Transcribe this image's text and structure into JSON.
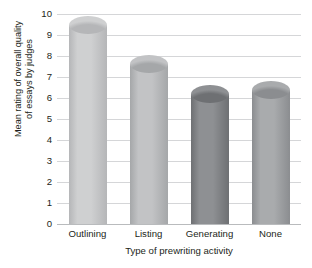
{
  "chart_data": {
    "type": "bar",
    "title": "",
    "xlabel": "Type of prewriting activity",
    "ylabel": "Mean rating of overall quality of essays by judges",
    "ylabel_lines": [
      "Mean rating of overall quality",
      "of essays by judges"
    ],
    "categories": [
      "Outlining",
      "Listing",
      "Generating",
      "None"
    ],
    "values": [
      9.5,
      7.6,
      6.2,
      6.4
    ],
    "ylim": [
      0,
      10
    ],
    "ytick_labels": [
      "10",
      "9",
      "8",
      "7",
      "6",
      "5",
      "4",
      "3",
      "2",
      "1",
      "0"
    ],
    "ytick_values": [
      10,
      9,
      8,
      7,
      6,
      5,
      4,
      3,
      2,
      1,
      0
    ],
    "grid": true,
    "legend": "none",
    "bar_colors": [
      "#cfd0d1",
      "#c2c3c5",
      "#8e9093",
      "#a9abad"
    ],
    "bar_colors_dark": [
      "#b5b6b8",
      "#a5a7a9",
      "#6e7073",
      "#8b8d90"
    ],
    "gridline_color": "#d5d6d8",
    "axis_color": "#b9bbbd",
    "text_color": "#231f20",
    "background": "#ffffff"
  }
}
